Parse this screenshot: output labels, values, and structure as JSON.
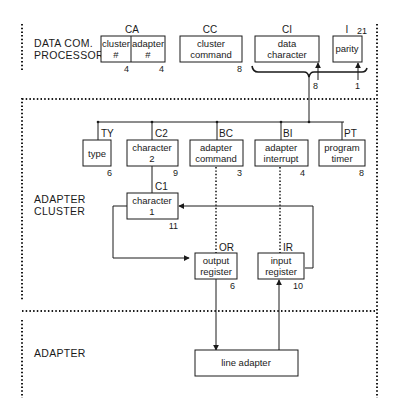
{
  "sections": {
    "dcp": {
      "line1": "DATA COM.",
      "line2": "PROCESSOR"
    },
    "cluster": {
      "line1": "ADAPTER",
      "line2": "CLUSTER"
    },
    "adapter": {
      "line1": "ADAPTER"
    }
  },
  "dcp_registers": {
    "ca": {
      "label": "CA",
      "cluster_l1": "cluster",
      "cluster_l2": "#",
      "cluster_bits": "4",
      "adapter_l1": "adapter",
      "adapter_l2": "#",
      "adapter_bits": "4"
    },
    "cc": {
      "label": "CC",
      "l1": "cluster",
      "l2": "command",
      "bits": "8"
    },
    "ci": {
      "label": "CI",
      "l1": "data",
      "l2": "character",
      "bits": "8"
    },
    "i21": {
      "label": "I",
      "sub": "21",
      "l1": "parity",
      "bits": "1"
    }
  },
  "cluster_registers": {
    "ty": {
      "label": "TY",
      "l1": "type",
      "bits": "6"
    },
    "c2": {
      "label": "C2",
      "l1": "character",
      "l2": "2",
      "bits": "9"
    },
    "bc": {
      "label": "BC",
      "l1": "adapter",
      "l2": "command",
      "bits": "3"
    },
    "bi": {
      "label": "BI",
      "l1": "adapter",
      "l2": "interrupt",
      "bits": "4"
    },
    "pt": {
      "label": "PT",
      "l1": "program",
      "l2": "timer",
      "bits": "8"
    },
    "c1": {
      "label": "C1",
      "l1": "character",
      "l2": "1",
      "bits": "11"
    },
    "or": {
      "label": "OR",
      "l1": "output",
      "l2": "register",
      "bits": "6"
    },
    "ir": {
      "label": "IR",
      "l1": "input",
      "l2": "register",
      "bits": "10"
    }
  },
  "adapter_unit": {
    "l1": "line adapter"
  }
}
